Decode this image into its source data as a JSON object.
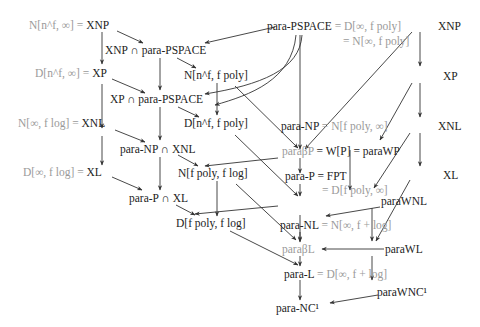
{
  "diagram": {
    "type": "complexity-class-inclusion-diagram",
    "colors": {
      "class_text": "#222222",
      "equivalent_text": "#9a9a9a",
      "edge": "#333333",
      "background": "#ffffff"
    },
    "nodes": {
      "xnp_left": {
        "gray": "N[n^f, ∞] = ",
        "dark": "XNP"
      },
      "xnp_cap_pspace": {
        "dark": "XNP ∩ para-PSPACE"
      },
      "xp_left": {
        "gray": "D[n^f, ∞] = ",
        "dark": "XP"
      },
      "n_nf_fpoly": {
        "dark": "N[n^f, f poly]"
      },
      "xp_cap_pspace": {
        "dark": "XP ∩ para-PSPACE"
      },
      "d_nf_fpoly": {
        "dark": "D[n^f, f poly]"
      },
      "xnl_left": {
        "gray": "N[∞, f log] = ",
        "dark": "XNL"
      },
      "paraNP_cap_xnl": {
        "dark": "para-NP ∩ XNL"
      },
      "xl_left": {
        "gray": "D[∞, f log] = ",
        "dark": "XL"
      },
      "n_fpoly_flog": {
        "dark": "N[f poly, f log]"
      },
      "paraP_cap_xl": {
        "dark": "para-P ∩ XL"
      },
      "d_fpoly_flog": {
        "dark": "D[f poly, f log]"
      },
      "para_pspace": {
        "dark": "para-PSPACE",
        "gray": " = D[∞, f poly]",
        "gray2": "= N[∞, f poly]"
      },
      "xnp_right": {
        "dark": "XNP"
      },
      "xp_right": {
        "dark": "XP"
      },
      "xnl_right": {
        "dark": "XNL"
      },
      "xl_right": {
        "dark": "XL"
      },
      "para_np": {
        "dark": "para-NP",
        "gray": " = N[f poly, ∞]"
      },
      "para_beta_p": {
        "gray": "paraβP",
        "dark_eq": " = W[P] = ",
        "right": "paraWP"
      },
      "para_p": {
        "dark": "para-P = FPT",
        "gray2": "= D[f poly, ∞]"
      },
      "para_wnl": {
        "dark": "paraWNL"
      },
      "para_nl": {
        "dark": "para-NL",
        "gray": " = N[∞, f + log]"
      },
      "para_beta_l": {
        "gray": "paraβL"
      },
      "para_wl": {
        "dark": "paraWL"
      },
      "para_l": {
        "dark": "para-L",
        "gray": " = D[∞, f + log]"
      },
      "para_wnc1": {
        "dark": "paraWNC¹"
      },
      "para_nc1": {
        "dark": "para-NC¹"
      }
    },
    "edges": [
      [
        "xnp_left",
        "xnp_cap_pspace"
      ],
      [
        "xnp_left",
        "xp_left"
      ],
      [
        "para_pspace",
        "xnp_cap_pspace"
      ],
      [
        "xnp_cap_pspace",
        "n_nf_fpoly"
      ],
      [
        "xnp_cap_pspace",
        "xp_cap_pspace"
      ],
      [
        "xp_left",
        "xp_cap_pspace"
      ],
      [
        "xp_left",
        "xnl_left"
      ],
      [
        "para_pspace",
        "xp_cap_pspace"
      ],
      [
        "para_pspace",
        "d_nf_fpoly"
      ],
      [
        "para_pspace",
        "para_np"
      ],
      [
        "n_nf_fpoly",
        "d_nf_fpoly"
      ],
      [
        "n_nf_fpoly",
        "para_np"
      ],
      [
        "xp_cap_pspace",
        "d_nf_fpoly"
      ],
      [
        "xp_cap_pspace",
        "paraNP_cap_xnl"
      ],
      [
        "xnp_right",
        "para_np"
      ],
      [
        "xnp_right",
        "xp_right"
      ],
      [
        "xp_right",
        "xnl_right"
      ],
      [
        "xp_right",
        "para_beta_p"
      ],
      [
        "xnl_left",
        "paraNP_cap_xnl"
      ],
      [
        "xnl_left",
        "xl_left"
      ],
      [
        "para_np",
        "paraNP_cap_xnl"
      ],
      [
        "para_np",
        "para_beta_p"
      ],
      [
        "d_nf_fpoly",
        "para_p"
      ],
      [
        "paraNP_cap_xnl",
        "n_fpoly_flog"
      ],
      [
        "paraNP_cap_xnl",
        "paraP_cap_xl"
      ],
      [
        "xl_left",
        "paraP_cap_xl"
      ],
      [
        "para_beta_p",
        "para_p"
      ],
      [
        "xnl_right",
        "xl_right"
      ],
      [
        "xnl_right",
        "para_wnl"
      ],
      [
        "para_p",
        "paraP_cap_xl"
      ],
      [
        "para_p",
        "para_nl"
      ],
      [
        "n_fpoly_flog",
        "d_fpoly_flog"
      ],
      [
        "n_fpoly_flog",
        "para_nl"
      ],
      [
        "paraP_cap_xl",
        "d_fpoly_flog"
      ],
      [
        "para_wp",
        "para_wnl"
      ],
      [
        "para_wnl",
        "para_nl"
      ],
      [
        "para_wnl",
        "para_wl"
      ],
      [
        "xl_right",
        "para_wl"
      ],
      [
        "para_nl",
        "para_beta_l"
      ],
      [
        "para_wl",
        "para_beta_l"
      ],
      [
        "para_beta_l",
        "para_l"
      ],
      [
        "d_fpoly_flog",
        "para_l"
      ],
      [
        "para_wl",
        "para_wnc1"
      ],
      [
        "para_l",
        "para_nc1"
      ],
      [
        "para_wnc1",
        "para_nc1"
      ]
    ]
  }
}
